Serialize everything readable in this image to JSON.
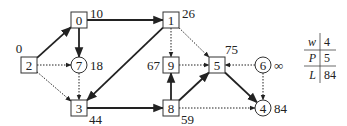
{
  "graph": {
    "nodes": [
      {
        "id": "2",
        "shape": "square",
        "x": 29,
        "y": 65,
        "dist": "0",
        "dist_pos": "above-left"
      },
      {
        "id": "0",
        "shape": "square",
        "x": 79,
        "y": 20,
        "dist": "10",
        "dist_pos": "right"
      },
      {
        "id": "7",
        "shape": "circle",
        "x": 79,
        "y": 65,
        "dist": "18",
        "dist_pos": "right"
      },
      {
        "id": "3",
        "shape": "square",
        "x": 79,
        "y": 108,
        "dist": "44",
        "dist_pos": "below-right"
      },
      {
        "id": "1",
        "shape": "square",
        "x": 171,
        "y": 20,
        "dist": "26",
        "dist_pos": "right"
      },
      {
        "id": "9",
        "shape": "square",
        "x": 171,
        "y": 65,
        "dist": "67",
        "dist_pos": "left"
      },
      {
        "id": "8",
        "shape": "square",
        "x": 171,
        "y": 108,
        "dist": "59",
        "dist_pos": "below-right"
      },
      {
        "id": "5",
        "shape": "square",
        "x": 217,
        "y": 65,
        "dist": "75",
        "dist_pos": "above"
      },
      {
        "id": "6",
        "shape": "circle",
        "x": 263,
        "y": 65,
        "dist": "∞",
        "dist_pos": "right"
      },
      {
        "id": "4",
        "shape": "circle",
        "x": 263,
        "y": 108,
        "dist": "84",
        "dist_pos": "right"
      }
    ],
    "edges": [
      {
        "from": "2",
        "to": "0",
        "style": "bold"
      },
      {
        "from": "0",
        "to": "7",
        "style": "bold"
      },
      {
        "from": "0",
        "to": "1",
        "style": "bold"
      },
      {
        "from": "1",
        "to": "3",
        "style": "bold"
      },
      {
        "from": "3",
        "to": "8",
        "style": "bold"
      },
      {
        "from": "8",
        "to": "9",
        "style": "bold"
      },
      {
        "from": "8",
        "to": "5",
        "style": "bold"
      },
      {
        "from": "5",
        "to": "4",
        "style": "bold"
      },
      {
        "from": "2",
        "to": "7",
        "style": "dotted"
      },
      {
        "from": "2",
        "to": "3",
        "style": "dotted"
      },
      {
        "from": "7",
        "to": "3",
        "style": "dotted"
      },
      {
        "from": "1",
        "to": "9",
        "style": "dotted"
      },
      {
        "from": "1",
        "to": "5",
        "style": "dotted"
      },
      {
        "from": "9",
        "to": "5",
        "style": "dotted"
      },
      {
        "from": "6",
        "to": "5",
        "style": "dotted"
      },
      {
        "from": "6",
        "to": "4",
        "style": "dotted"
      },
      {
        "from": "8",
        "to": "4",
        "style": "dotted"
      }
    ]
  },
  "table": {
    "rows": [
      {
        "key": "w",
        "value": "4"
      },
      {
        "key": "P",
        "value": "5"
      },
      {
        "key": "L",
        "value": "84"
      }
    ]
  }
}
